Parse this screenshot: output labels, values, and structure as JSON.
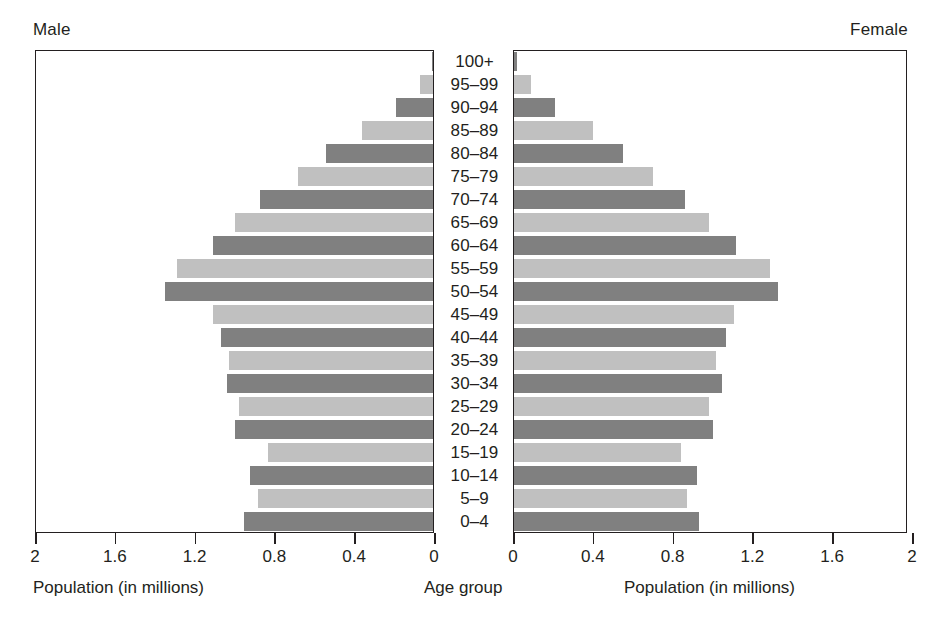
{
  "header": {
    "male_label": "Male",
    "female_label": "Female"
  },
  "captions": {
    "left": "Population (in millions)",
    "center": "Age group",
    "right": "Population (in millions)"
  },
  "axis": {
    "left_ticks": [
      "2",
      "1.6",
      "1.2",
      "0.8",
      "0.4",
      "0"
    ],
    "right_ticks": [
      "0",
      "0.4",
      "0.8",
      "1.2",
      "1.6",
      "2"
    ]
  },
  "chart_data": {
    "type": "bar",
    "subtype": "population-pyramid",
    "title": "",
    "xlabel": "Population (in millions)",
    "ylabel": "Age group",
    "categories": [
      "100+",
      "95–99",
      "90–94",
      "85–89",
      "80–84",
      "75–79",
      "70–74",
      "65–69",
      "60–64",
      "55–59",
      "50–54",
      "45–49",
      "40–44",
      "35–39",
      "30–34",
      "25–29",
      "20–24",
      "15–19",
      "10–14",
      "5–9",
      "0–4"
    ],
    "series": [
      {
        "name": "Male",
        "side": "left",
        "values": [
          0.01,
          0.07,
          0.19,
          0.36,
          0.54,
          0.68,
          0.87,
          1.0,
          1.11,
          1.29,
          1.35,
          1.11,
          1.07,
          1.03,
          1.04,
          0.98,
          1.0,
          0.83,
          0.92,
          0.88,
          0.95
        ]
      },
      {
        "name": "Female",
        "side": "right",
        "values": [
          0.02,
          0.09,
          0.21,
          0.4,
          0.55,
          0.7,
          0.86,
          0.98,
          1.12,
          1.29,
          1.33,
          1.11,
          1.07,
          1.02,
          1.05,
          0.98,
          1.0,
          0.84,
          0.92,
          0.87,
          0.93
        ]
      }
    ],
    "xlim": [
      0,
      2
    ],
    "x_ticks": [
      0,
      0.4,
      0.8,
      1.2,
      1.6,
      2
    ],
    "grid": false,
    "legend": "none",
    "colors": {
      "bar_dark": "#808080",
      "bar_light": "#c0c0c0",
      "axis": "#231f20",
      "background": "#ffffff"
    }
  }
}
